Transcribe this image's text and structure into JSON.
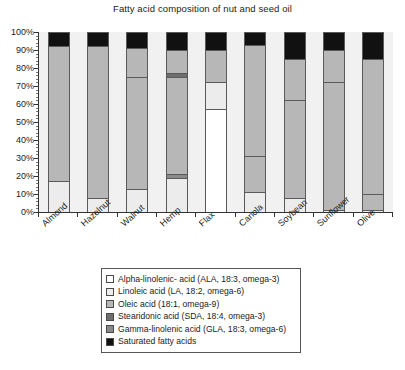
{
  "chart_data": {
    "type": "bar",
    "subtype": "stacked-percentage-column",
    "title": "Fatty acid composition of nut and seed oil",
    "xlabel": "",
    "ylabel": "",
    "ylim": [
      0,
      100
    ],
    "ytick_labels": [
      "0%",
      "10%",
      "20%",
      "30%",
      "40%",
      "50%",
      "60%",
      "70%",
      "80%",
      "90%",
      "100%"
    ],
    "ytick_values": [
      0,
      10,
      20,
      30,
      40,
      50,
      60,
      70,
      80,
      90,
      100
    ],
    "grid": false,
    "legend_position": "bottom",
    "categories": [
      "Almond",
      "Hazelnut",
      "Walnut",
      "Hemp",
      "Flax",
      "Canola",
      "Soybean",
      "Sunflower",
      "Olive"
    ],
    "series": [
      {
        "name": "Alpha-linolenic- acid (ALA, 18:3, omega-3)",
        "key": "ala",
        "color": "#ffffff",
        "values": [
          0,
          0,
          0,
          0,
          57,
          0,
          0,
          0,
          0
        ]
      },
      {
        "name": "Linoleic acid (LA, 18:2, omega-6)",
        "key": "la",
        "color": "#ececec",
        "values": [
          17,
          8,
          13,
          19,
          15,
          11,
          8,
          1,
          1
        ]
      },
      {
        "name": "Gamma-linolenic acid (GLA, 18:3, omega-6)",
        "key": "gla",
        "color": "#8a8a8a",
        "values": [
          0,
          0,
          0,
          2,
          0,
          0,
          0,
          0,
          0
        ]
      },
      {
        "name": "Oleic acid (18:1, omega-9)",
        "key": "oleic",
        "color": "#b7b7b7",
        "values": [
          75,
          84,
          62,
          54,
          0,
          20,
          54,
          71,
          9
        ]
      },
      {
        "name": "Stearidonic acid (SDA, 18:4, omega-3)",
        "key": "sda",
        "color": "#6e6e6e",
        "values": [
          0,
          0,
          0,
          2,
          0,
          0,
          0,
          0,
          0
        ]
      },
      {
        "name": "Oleic acid upper (18:1, omega-9)",
        "key": "oleic2",
        "color": "#b7b7b7",
        "values": [
          0,
          0,
          16,
          13,
          18,
          62,
          23,
          18,
          75
        ]
      },
      {
        "name": "Saturated fatty acids",
        "key": "sat",
        "color": "#111111",
        "values": [
          8,
          8,
          9,
          10,
          10,
          7,
          15,
          10,
          15
        ]
      }
    ],
    "stack_order": [
      "ala",
      "la",
      "gla",
      "oleic",
      "sda",
      "oleic2",
      "sat"
    ],
    "bar_breakpoints_percent": {
      "Almond": [
        {
          "key": "la",
          "from": 0,
          "to": 17
        },
        {
          "key": "oleic",
          "from": 17,
          "to": 92
        },
        {
          "key": "sat",
          "from": 92,
          "to": 100
        }
      ],
      "Hazelnut": [
        {
          "key": "la",
          "from": 0,
          "to": 8
        },
        {
          "key": "oleic",
          "from": 8,
          "to": 92
        },
        {
          "key": "sat",
          "from": 92,
          "to": 100
        }
      ],
      "Walnut": [
        {
          "key": "la",
          "from": 0,
          "to": 13
        },
        {
          "key": "oleic",
          "from": 13,
          "to": 75
        },
        {
          "key": "oleic2",
          "from": 75,
          "to": 91
        },
        {
          "key": "sat",
          "from": 91,
          "to": 100
        }
      ],
      "Hemp": [
        {
          "key": "la",
          "from": 0,
          "to": 19
        },
        {
          "key": "gla",
          "from": 19,
          "to": 21
        },
        {
          "key": "oleic",
          "from": 21,
          "to": 75
        },
        {
          "key": "sda",
          "from": 75,
          "to": 77
        },
        {
          "key": "oleic2",
          "from": 77,
          "to": 90
        },
        {
          "key": "sat",
          "from": 90,
          "to": 100
        }
      ],
      "Flax": [
        {
          "key": "ala",
          "from": 0,
          "to": 57
        },
        {
          "key": "la",
          "from": 57,
          "to": 72
        },
        {
          "key": "oleic2",
          "from": 72,
          "to": 90
        },
        {
          "key": "sat",
          "from": 90,
          "to": 100
        }
      ],
      "Canola": [
        {
          "key": "la",
          "from": 0,
          "to": 11
        },
        {
          "key": "oleic",
          "from": 11,
          "to": 31
        },
        {
          "key": "oleic2",
          "from": 31,
          "to": 93
        },
        {
          "key": "sat",
          "from": 93,
          "to": 100
        }
      ],
      "Soybean": [
        {
          "key": "la",
          "from": 0,
          "to": 8
        },
        {
          "key": "oleic",
          "from": 8,
          "to": 62
        },
        {
          "key": "oleic2",
          "from": 62,
          "to": 85
        },
        {
          "key": "sat",
          "from": 85,
          "to": 100
        }
      ],
      "Sunflower": [
        {
          "key": "la",
          "from": 0,
          "to": 1
        },
        {
          "key": "oleic",
          "from": 1,
          "to": 72
        },
        {
          "key": "oleic2",
          "from": 72,
          "to": 90
        },
        {
          "key": "sat",
          "from": 90,
          "to": 100
        }
      ],
      "Olive": [
        {
          "key": "la",
          "from": 0,
          "to": 1
        },
        {
          "key": "oleic",
          "from": 1,
          "to": 10
        },
        {
          "key": "oleic2",
          "from": 10,
          "to": 85
        },
        {
          "key": "sat",
          "from": 85,
          "to": 100
        }
      ]
    },
    "legend_entries": [
      {
        "label": "Alpha-linolenic- acid (ALA, 18:3, omega-3)",
        "color": "#ffffff"
      },
      {
        "label": "Linoleic acid (LA, 18:2, omega-6)",
        "color": "#ececec"
      },
      {
        "label": "Oleic acid (18:1, omega-9)",
        "color": "#b7b7b7"
      },
      {
        "label": "Stearidonic acid (SDA, 18:4, omega-3)",
        "color": "#6e6e6e"
      },
      {
        "label": "Gamma-linolenic acid (GLA, 18:3, omega-6)",
        "color": "#8a8a8a"
      },
      {
        "label": "Saturated fatty acids",
        "color": "#111111"
      }
    ]
  },
  "colors": {
    "plot_background": "#f1f1f1",
    "axis": "#333333",
    "segment_border": "#5a5a5a",
    "text": "#1c1c1c"
  }
}
